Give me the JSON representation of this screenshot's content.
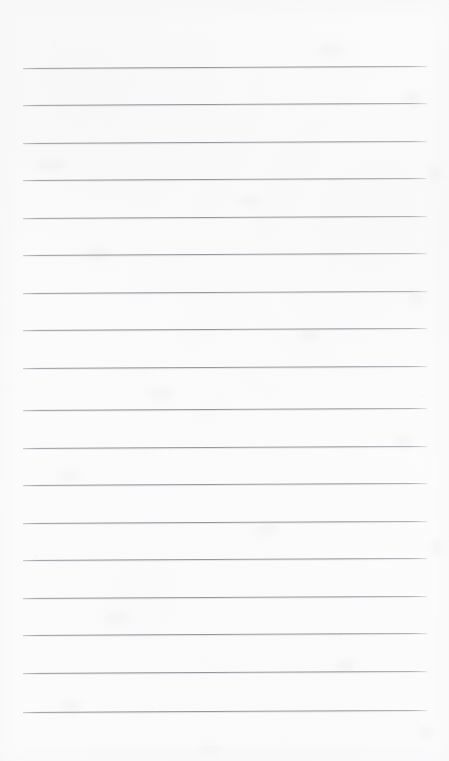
{
  "document": {
    "kind": "scanned-lined-paper",
    "title": "Blank Ruled Notepad Page",
    "background_color": "#ffffff",
    "rule_color": "#8a8c93",
    "width_px": 449,
    "height_px": 761,
    "text_content": "",
    "has_handwriting": false,
    "has_printed_text": false
  },
  "ruling": {
    "line_count": 18,
    "first_line_y": 68,
    "line_spacing": 37.3,
    "line_start_x": 23,
    "line_end_x": 427,
    "line_thickness": 1,
    "skew_degrees": -0.28,
    "top_margin_px": 68,
    "bottom_margin_px": 48,
    "left_margin_px": 23,
    "right_margin_px": 22,
    "lines": [
      {
        "index": 1,
        "y": 68,
        "label": "rule-line-1"
      },
      {
        "index": 2,
        "y": 105,
        "label": "rule-line-2"
      },
      {
        "index": 3,
        "y": 143,
        "label": "rule-line-3"
      },
      {
        "index": 4,
        "y": 180,
        "label": "rule-line-4"
      },
      {
        "index": 5,
        "y": 218,
        "label": "rule-line-5"
      },
      {
        "index": 6,
        "y": 255,
        "label": "rule-line-6"
      },
      {
        "index": 7,
        "y": 293,
        "label": "rule-line-7"
      },
      {
        "index": 8,
        "y": 330,
        "label": "rule-line-8"
      },
      {
        "index": 9,
        "y": 368,
        "label": "rule-line-9"
      },
      {
        "index": 10,
        "y": 410,
        "label": "rule-line-10"
      },
      {
        "index": 11,
        "y": 448,
        "label": "rule-line-11"
      },
      {
        "index": 12,
        "y": 485,
        "label": "rule-line-12"
      },
      {
        "index": 13,
        "y": 523,
        "label": "rule-line-13"
      },
      {
        "index": 14,
        "y": 560,
        "label": "rule-line-14"
      },
      {
        "index": 15,
        "y": 598,
        "label": "rule-line-15"
      },
      {
        "index": 16,
        "y": 635,
        "label": "rule-line-16"
      },
      {
        "index": 17,
        "y": 673,
        "label": "rule-line-17"
      },
      {
        "index": 18,
        "y": 712,
        "label": "rule-line-18"
      }
    ]
  },
  "artifacts": {
    "smudges": [
      {
        "x": 318,
        "y": 44,
        "w": 26,
        "h": 12
      },
      {
        "x": 404,
        "y": 92,
        "w": 18,
        "h": 14
      },
      {
        "x": 36,
        "y": 160,
        "w": 30,
        "h": 11
      },
      {
        "x": 238,
        "y": 196,
        "w": 22,
        "h": 10
      },
      {
        "x": 428,
        "y": 166,
        "w": 14,
        "h": 16
      },
      {
        "x": 86,
        "y": 248,
        "w": 24,
        "h": 12
      },
      {
        "x": 300,
        "y": 330,
        "w": 20,
        "h": 11
      },
      {
        "x": 408,
        "y": 290,
        "w": 16,
        "h": 14
      },
      {
        "x": 148,
        "y": 388,
        "w": 26,
        "h": 12
      },
      {
        "x": 58,
        "y": 470,
        "w": 22,
        "h": 12
      },
      {
        "x": 394,
        "y": 436,
        "w": 18,
        "h": 13
      },
      {
        "x": 254,
        "y": 524,
        "w": 24,
        "h": 11
      },
      {
        "x": 430,
        "y": 540,
        "w": 14,
        "h": 15
      },
      {
        "x": 104,
        "y": 612,
        "w": 26,
        "h": 12
      },
      {
        "x": 336,
        "y": 660,
        "w": 20,
        "h": 11
      },
      {
        "x": 60,
        "y": 700,
        "w": 22,
        "h": 12
      },
      {
        "x": 198,
        "y": 744,
        "w": 24,
        "h": 10
      },
      {
        "x": 418,
        "y": 726,
        "w": 16,
        "h": 14
      }
    ]
  }
}
